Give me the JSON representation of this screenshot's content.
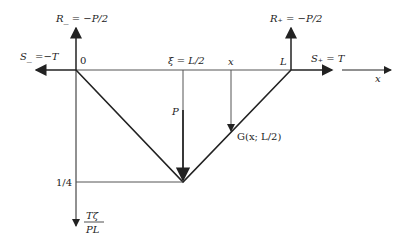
{
  "diagram": {
    "labels": {
      "origin": "0",
      "xi": "ξ = L/2",
      "x_mark": "x",
      "L": "L",
      "x_axis": "x",
      "R_minus": "R_ = −P/2",
      "R_plus": "R₊ = −P/2",
      "S_minus": "S_ =−T",
      "S_plus": "S₊ = T",
      "P": "P",
      "G": "G(x; L/2)",
      "quarter": "1/4",
      "y_axis_num": "Tζ",
      "y_axis_den": "PL"
    },
    "colors": {
      "line": "#222222",
      "thin_line": "#555555"
    }
  }
}
